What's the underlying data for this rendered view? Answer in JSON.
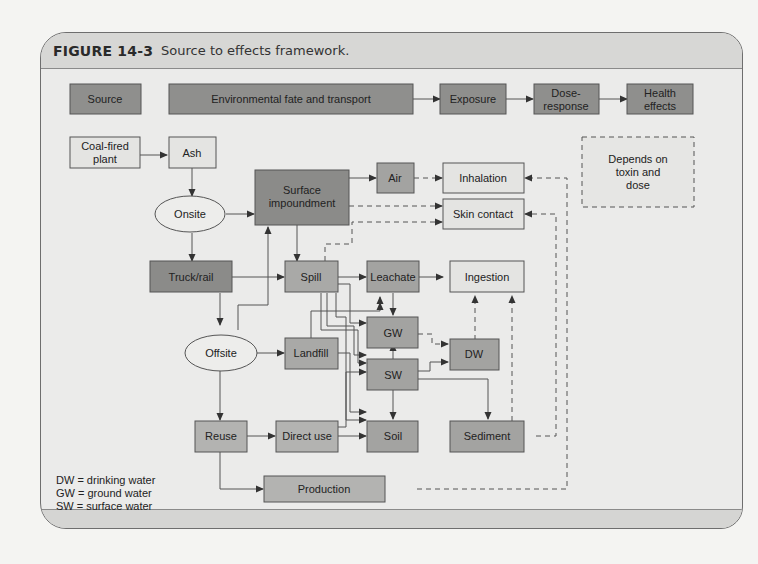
{
  "caption": {
    "number": "FIGURE 14-3",
    "text": "Source to effects framework."
  },
  "top_row": {
    "source": "Source",
    "fate": "Environmental fate and transport",
    "exposure": "Exposure",
    "dose_response": [
      "Dose-",
      "response"
    ],
    "health": [
      "Health",
      "effects"
    ]
  },
  "nodes": {
    "coal": [
      "Coal-fired",
      "plant"
    ],
    "ash": "Ash",
    "onsite": "Onsite",
    "surface": [
      "Surface",
      "impoundment"
    ],
    "air": "Air",
    "inhalation": "Inhalation",
    "skin": "Skin contact",
    "truck": "Truck/rail",
    "spill": "Spill",
    "leachate": "Leachate",
    "ingestion": "Ingestion",
    "gw": "GW",
    "dw": "DW",
    "offsite": "Offsite",
    "landfill": "Landfill",
    "sw": "SW",
    "reuse": "Reuse",
    "direct": "Direct use",
    "soil": "Soil",
    "sediment": "Sediment",
    "production": "Production",
    "depends": [
      "Depends on",
      "toxin and",
      "dose"
    ]
  },
  "legend": [
    "DW = drinking water",
    "GW = ground water",
    "SW = surface water"
  ],
  "colors": {
    "dark_box": "#8d8d8b",
    "mid_box": "#a9a9a7",
    "light_box": "#e2e2e0",
    "line": "#444444"
  }
}
